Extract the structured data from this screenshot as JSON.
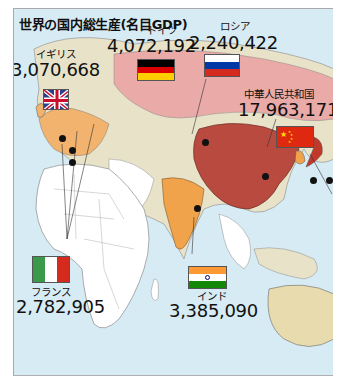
{
  "title": "世界の国内総生産(名目GDP)",
  "colors": {
    "ocean": "#cfe6f2",
    "land_base": "#e9e2c9",
    "africa": "#ffffff",
    "border": "#8a8a8a",
    "china": "#c0392b",
    "russia": "#e9a6a6",
    "india": "#f0a34a",
    "europe": "#f2b26b",
    "japan": "#c0392b",
    "australia": "#e8dcae",
    "se_asia": "#bfe0ea"
  },
  "countries": [
    {
      "id": "uk",
      "name": "イギリス",
      "value": "3,070,668",
      "flag": "uk"
    },
    {
      "id": "germany",
      "name": "ドイツ",
      "value": "4,072,192",
      "flag": "germany"
    },
    {
      "id": "russia",
      "name": "ロシア",
      "value": "2,240,422",
      "flag": "russia"
    },
    {
      "id": "china",
      "name": "中華人民共和国",
      "value": "17,963,171",
      "flag": "china"
    },
    {
      "id": "france",
      "name": "フランス",
      "value": "2,782,905",
      "flag": "tricolor-vertical"
    },
    {
      "id": "india",
      "name": "インド",
      "value": "3,385,090",
      "flag": "india"
    }
  ]
}
